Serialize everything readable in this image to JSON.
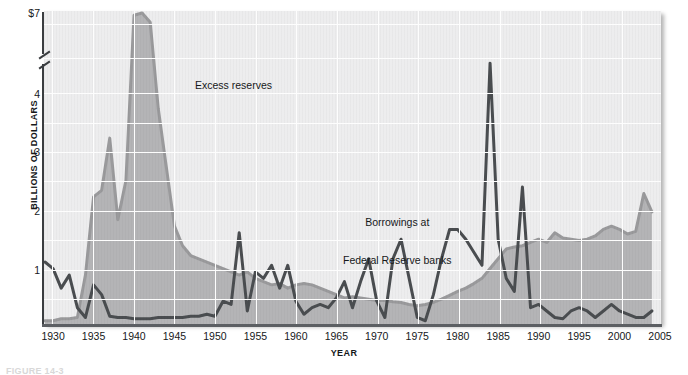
{
  "figure": {
    "caption": "FIGURE 14-3",
    "ylabel": "BILLIONS OF DOLLARS",
    "xlabel": "YEAR"
  },
  "annotations": {
    "excess": "Excess reserves",
    "borrowings_line1": "Borrowings at",
    "borrowings_line2": "Federal Reserve banks"
  },
  "colors": {
    "plot_background": "#ededee",
    "gridline": "#fdfdfd",
    "excess_reserves_line": "#9a9a9c",
    "excess_reserves_fill": "#b4b4b6",
    "borrowings_line": "#4a4d50",
    "axis": "#3b3e41",
    "text": "#16181a"
  },
  "chart_data": {
    "type": "line",
    "title": "",
    "xlabel": "YEAR",
    "ylabel": "BILLIONS OF DOLLARS",
    "xlim": [
      1929,
      2005
    ],
    "ylim": [
      0,
      4.6
    ],
    "y_axis_break": true,
    "y_axis_break_note": "Axis is broken between 4.6 and 7; topmost tick is $7",
    "ytick_labels": [
      "$7",
      "4",
      "3",
      "2",
      "1"
    ],
    "ytick_values": [
      7,
      4,
      3,
      2,
      1
    ],
    "xtick_labels": [
      "1930",
      "1935",
      "1940",
      "1945",
      "1950",
      "1955",
      "1960",
      "1965",
      "1970",
      "1975",
      "1980",
      "1985",
      "1990",
      "1995",
      "2000",
      "2005"
    ],
    "xtick_values": [
      1930,
      1935,
      1940,
      1945,
      1950,
      1955,
      1960,
      1965,
      1970,
      1975,
      1980,
      1985,
      1990,
      1995,
      2000,
      2005
    ],
    "grid": true,
    "grid_minor_y_step": 0.5,
    "grid_x_step": 5,
    "legend": "inline-annotations",
    "legend_position": "in-plot",
    "series": [
      {
        "name": "Excess reserves",
        "color": "#9a9a9c",
        "fill": true,
        "x": [
          1929,
          1930,
          1931,
          1932,
          1933,
          1934,
          1935,
          1936,
          1937,
          1938,
          1939,
          1940,
          1941,
          1942,
          1943,
          1944,
          1945,
          1946,
          1947,
          1948,
          1949,
          1950,
          1951,
          1952,
          1953,
          1954,
          1955,
          1956,
          1957,
          1958,
          1959,
          1960,
          1961,
          1962,
          1963,
          1964,
          1965,
          1966,
          1967,
          1968,
          1969,
          1970,
          1971,
          1972,
          1973,
          1974,
          1975,
          1976,
          1977,
          1978,
          1979,
          1980,
          1981,
          1982,
          1983,
          1984,
          1985,
          1986,
          1987,
          1988,
          1989,
          1990,
          1991,
          1992,
          1993,
          1994,
          1995,
          1996,
          1997,
          1998,
          1999,
          2000,
          2001,
          2002,
          2003,
          2004
        ],
        "y": [
          0.05,
          0.05,
          0.08,
          0.08,
          0.1,
          0.75,
          1.95,
          2.05,
          2.85,
          1.6,
          2.2,
          6.5,
          7.0,
          5.0,
          3.3,
          2.4,
          1.5,
          1.2,
          1.05,
          1.0,
          0.95,
          0.9,
          0.85,
          0.8,
          0.75,
          0.8,
          0.7,
          0.65,
          0.6,
          0.62,
          0.55,
          0.6,
          0.62,
          0.6,
          0.55,
          0.5,
          0.45,
          0.4,
          0.42,
          0.4,
          0.38,
          0.36,
          0.36,
          0.34,
          0.33,
          0.3,
          0.28,
          0.3,
          0.33,
          0.38,
          0.44,
          0.5,
          0.55,
          0.62,
          0.7,
          0.85,
          1.0,
          1.15,
          1.18,
          1.2,
          1.25,
          1.3,
          1.25,
          1.4,
          1.32,
          1.3,
          1.28,
          1.3,
          1.35,
          1.45,
          1.5,
          1.45,
          1.38,
          1.42,
          2.0,
          1.72
        ],
        "units": "billions of dollars",
        "note": "Peaks at ~$7 billion around 1941; series is area-filled in light gray"
      },
      {
        "name": "Borrowings at Federal Reserve banks",
        "color": "#4a4d50",
        "fill": false,
        "x": [
          1929,
          1930,
          1931,
          1932,
          1933,
          1934,
          1935,
          1936,
          1937,
          1938,
          1939,
          1940,
          1941,
          1942,
          1943,
          1944,
          1945,
          1946,
          1947,
          1948,
          1949,
          1950,
          1951,
          1952,
          1953,
          1954,
          1955,
          1956,
          1957,
          1958,
          1959,
          1960,
          1961,
          1962,
          1963,
          1964,
          1965,
          1966,
          1967,
          1968,
          1969,
          1970,
          1971,
          1972,
          1973,
          1974,
          1975,
          1976,
          1977,
          1978,
          1979,
          1980,
          1981,
          1982,
          1983,
          1984,
          1985,
          1986,
          1987,
          1988,
          1989,
          1990,
          1991,
          1992,
          1993,
          1994,
          1995,
          1996,
          1997,
          1998,
          1999,
          2000,
          2001,
          2002,
          2003,
          2004
        ],
        "y": [
          0.95,
          0.85,
          0.55,
          0.75,
          0.25,
          0.1,
          0.6,
          0.45,
          0.12,
          0.1,
          0.1,
          0.08,
          0.08,
          0.08,
          0.1,
          0.1,
          0.1,
          0.1,
          0.12,
          0.12,
          0.15,
          0.12,
          0.35,
          0.3,
          1.4,
          0.2,
          0.8,
          0.7,
          0.9,
          0.55,
          0.9,
          0.35,
          0.15,
          0.25,
          0.3,
          0.25,
          0.4,
          0.65,
          0.25,
          0.65,
          1.0,
          0.35,
          0.1,
          1.0,
          1.3,
          0.7,
          0.1,
          0.05,
          0.45,
          1.0,
          1.45,
          1.45,
          1.3,
          1.1,
          0.9,
          4.0,
          1.3,
          0.7,
          0.5,
          2.1,
          0.25,
          0.3,
          0.2,
          0.1,
          0.08,
          0.2,
          0.25,
          0.2,
          0.1,
          0.2,
          0.3,
          0.2,
          0.15,
          0.1,
          0.1,
          0.2
        ],
        "units": "billions of dollars",
        "note": "Sharp spike to ~$4 billion in 1984 and ~$2.1 billion in 1988"
      }
    ]
  }
}
